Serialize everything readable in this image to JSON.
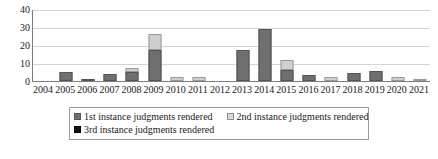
{
  "chart_data": {
    "type": "bar",
    "title": "",
    "subtitle": "",
    "xlabel": "",
    "ylabel": "",
    "stacked": true,
    "grid": true,
    "legend_position": "bottom",
    "ylim": [
      0,
      40
    ],
    "yticks": [
      0,
      10,
      20,
      30,
      40
    ],
    "ytick_labels": [
      "0",
      "10",
      "20",
      "30",
      "40"
    ],
    "categories": [
      "2004",
      "2005",
      "2006",
      "2007",
      "2008",
      "2009",
      "2010",
      "2011",
      "2012",
      "2013",
      "2014",
      "2015",
      "2016",
      "2017",
      "2018",
      "2019",
      "2020",
      "2021"
    ],
    "series": [
      {
        "name": "1st instance judgments rendered",
        "color": "#6f6f6f",
        "values": [
          0,
          5,
          1,
          4,
          5,
          17,
          0,
          0,
          0,
          17,
          29,
          6,
          3.5,
          0,
          4.5,
          5.5,
          0,
          0
        ]
      },
      {
        "name": "2nd instance judgments rendered",
        "color": "#cfcfcf",
        "values": [
          0,
          0,
          0,
          0,
          2,
          9,
          2.5,
          2.5,
          0,
          0,
          0,
          5.5,
          0,
          2.5,
          0,
          0,
          2,
          0.5
        ]
      },
      {
        "name": "3rd instance judgments rendered",
        "color": "#101010",
        "values": [
          0,
          0,
          0,
          0,
          0,
          0,
          0,
          0,
          0,
          0,
          0,
          0,
          0,
          0,
          0,
          0,
          0,
          0
        ]
      }
    ]
  },
  "legend": {
    "items": [
      {
        "label": "1st instance judgments rendered",
        "swatch": "series-1-swatch"
      },
      {
        "label": "2nd instance judgments rendered",
        "swatch": "series-2-swatch"
      },
      {
        "label": "3rd instance judgments rendered",
        "swatch": "series-3-swatch"
      }
    ]
  }
}
